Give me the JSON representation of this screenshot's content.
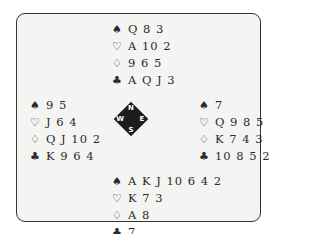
{
  "suits": {
    "spades": "♠",
    "hearts": "♡",
    "diamonds": "♢",
    "clubs": "♣"
  },
  "north": {
    "spades": "Q 8 3",
    "hearts": "A 10 2",
    "diamonds": "9 6 5",
    "clubs": "A Q J 3"
  },
  "west": {
    "spades": "9 5",
    "hearts": "J 6 4",
    "diamonds": "Q J 10 2",
    "clubs": "K 9 6 4"
  },
  "east": {
    "spades": "7",
    "hearts": "Q 9 8 5",
    "diamonds": "K 7 4 3",
    "clubs": "10 8 5 2"
  },
  "south": {
    "spades": "A K J 10 6 4 2",
    "hearts": "K 7 3",
    "diamonds": "A 8",
    "clubs": "7"
  },
  "compass": {
    "n": "N",
    "s": "S",
    "w": "W",
    "e": "E"
  }
}
